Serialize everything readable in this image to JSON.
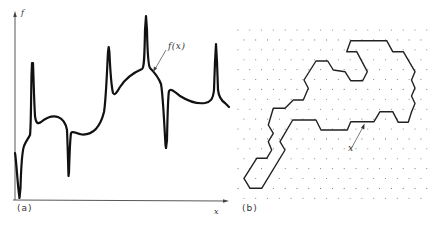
{
  "figure": {
    "panel_a": {
      "label": "(a)",
      "y_axis_label": "f",
      "x_axis_label": "x",
      "curve_annotation": "f(x)",
      "curve_color": "#111111",
      "description": "Irregular one-dimensional function f(x) with sharp spikes and dips"
    },
    "panel_b": {
      "label": "(b)",
      "point_annotation": "x",
      "lattice": "triangular dot lattice",
      "path_color": "#222222",
      "dot_color": "#777777",
      "description": "Closed self-avoiding lattice polygon on a triangular lattice"
    }
  }
}
